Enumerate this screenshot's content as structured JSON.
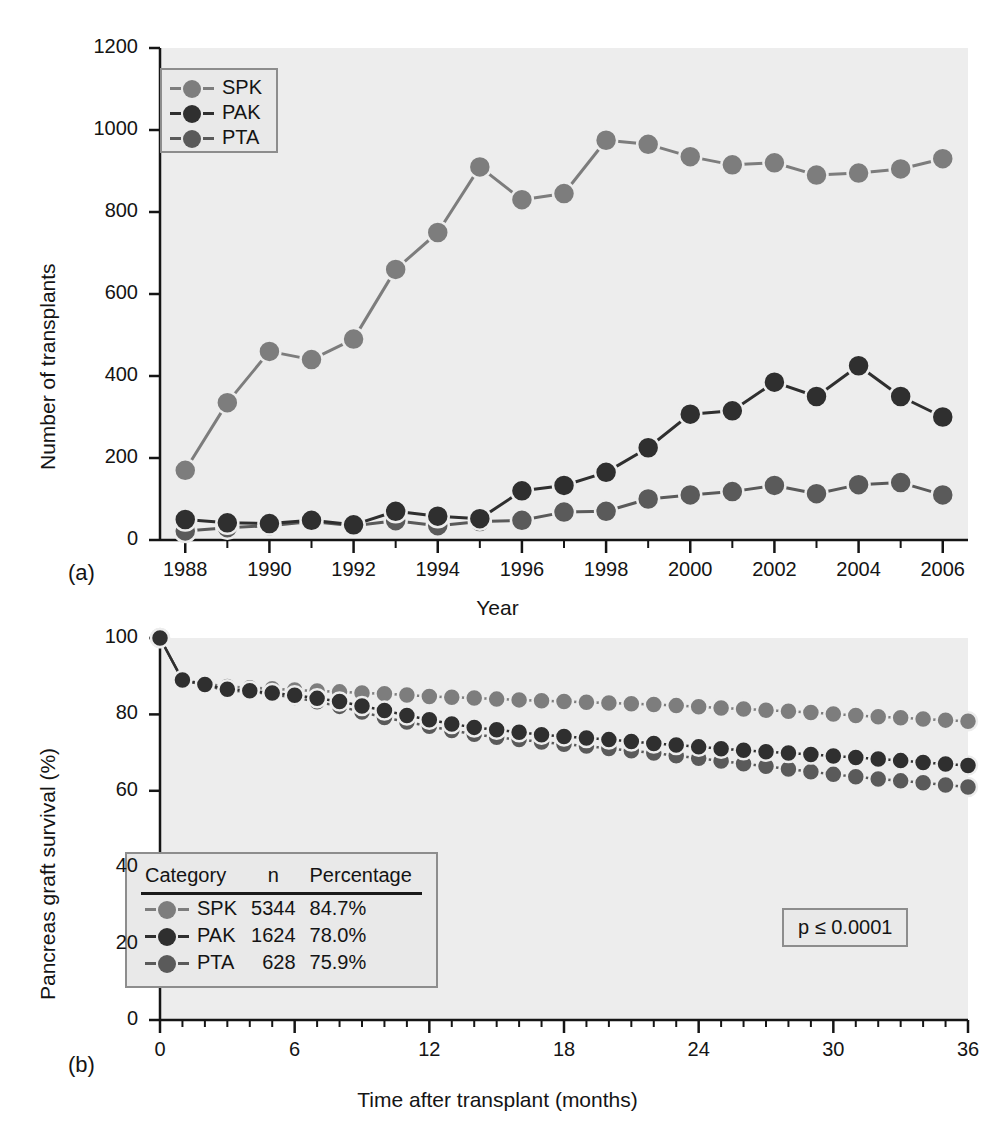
{
  "figure": {
    "panel_a_label": "(a)",
    "panel_b_label": "(b)"
  },
  "colors": {
    "spk": "#7d7d7d",
    "pak": "#2f2f2f",
    "pta": "#5a5a5a",
    "plot_bg": "#ededed",
    "axis": "#151515",
    "legend_border": "#8d8d8d",
    "legend_bg": "#e9e9e9"
  },
  "panel_a": {
    "legend": {
      "items": [
        {
          "label": "SPK",
          "color_key": "spk"
        },
        {
          "label": "PAK",
          "color_key": "pak"
        },
        {
          "label": "PTA",
          "color_key": "pta"
        }
      ]
    },
    "chart_data": {
      "type": "line",
      "title": "",
      "xlabel": "Year",
      "ylabel": "Number of transplants",
      "xlim": [
        1987.4,
        2006.6
      ],
      "ylim": [
        0,
        1200
      ],
      "yticks": [
        0,
        200,
        400,
        600,
        800,
        1000,
        1200
      ],
      "xticks": [
        1988,
        1990,
        1992,
        1994,
        1996,
        1998,
        2000,
        2002,
        2004,
        2006
      ],
      "xtick_labels": [
        "1988",
        "1990",
        "1992",
        "1994",
        "1996",
        "1998",
        "2000",
        "2002",
        "2004",
        "2006"
      ],
      "ytick_labels": [
        "0",
        "200",
        "400",
        "600",
        "800",
        "1000",
        "1200"
      ],
      "x": [
        1988,
        1989,
        1990,
        1991,
        1992,
        1993,
        1994,
        1995,
        1996,
        1997,
        1998,
        1999,
        2000,
        2001,
        2002,
        2003,
        2004,
        2005,
        2006
      ],
      "grid": false,
      "legend_position": "upper-left",
      "series": [
        {
          "name": "SPK",
          "color_key": "spk",
          "values": [
            170,
            335,
            460,
            440,
            490,
            660,
            750,
            910,
            830,
            845,
            975,
            965,
            935,
            915,
            920,
            890,
            895,
            905,
            930
          ]
        },
        {
          "name": "PAK",
          "color_key": "pak",
          "values": [
            50,
            42,
            40,
            48,
            37,
            70,
            58,
            52,
            120,
            133,
            165,
            225,
            307,
            315,
            385,
            350,
            425,
            350,
            300
          ]
        },
        {
          "name": "PTA",
          "color_key": "pta",
          "values": [
            22,
            30,
            35,
            45,
            35,
            47,
            35,
            45,
            48,
            68,
            70,
            100,
            110,
            118,
            133,
            113,
            135,
            140,
            110
          ]
        }
      ]
    }
  },
  "panel_b": {
    "table_legend": {
      "headers": [
        "Category",
        "n",
        "Percentage"
      ],
      "rows": [
        {
          "category": "SPK",
          "n": "5344",
          "percentage": "84.7%",
          "color_key": "spk"
        },
        {
          "category": "PAK",
          "n": "1624",
          "percentage": "78.0%",
          "color_key": "pak"
        },
        {
          "category": "PTA",
          "n": "628",
          "percentage": "75.9%",
          "color_key": "pta"
        }
      ]
    },
    "pvalue": "p ≤ 0.0001",
    "chart_data": {
      "type": "line",
      "title": "",
      "xlabel": "Time after transplant (months)",
      "ylabel": "Pancreas graft survival (%)",
      "xlim": [
        0,
        36
      ],
      "ylim": [
        0,
        100
      ],
      "yticks": [
        0,
        20,
        40,
        60,
        80,
        100
      ],
      "xticks": [
        0,
        6,
        12,
        18,
        24,
        30,
        36
      ],
      "xtick_labels": [
        "0",
        "6",
        "12",
        "18",
        "24",
        "30",
        "36"
      ],
      "ytick_labels": [
        "0",
        "20",
        "40",
        "60",
        "80",
        "100"
      ],
      "x_minor_step": 1,
      "x": [
        0,
        1,
        2,
        3,
        4,
        5,
        6,
        7,
        8,
        9,
        10,
        11,
        12,
        13,
        14,
        15,
        16,
        17,
        18,
        19,
        20,
        21,
        22,
        23,
        24,
        25,
        26,
        27,
        28,
        29,
        30,
        31,
        32,
        33,
        34,
        35,
        36
      ],
      "grid": false,
      "legend_position": "lower-left",
      "series": [
        {
          "name": "SPK",
          "color_key": "spk",
          "final_value": 84.7,
          "values": [
            100.0,
            89.0,
            88.0,
            87.3,
            87.0,
            86.7,
            86.4,
            86.1,
            85.9,
            85.6,
            85.4,
            85.1,
            84.7,
            84.5,
            84.3,
            84.0,
            83.8,
            83.6,
            83.4,
            83.2,
            83.0,
            82.8,
            82.6,
            82.3,
            82.0,
            81.7,
            81.4,
            81.1,
            80.8,
            80.5,
            80.1,
            79.7,
            79.4,
            79.1,
            78.8,
            78.5,
            78.2
          ]
        },
        {
          "name": "PAK",
          "color_key": "pak",
          "final_value": 78.0,
          "values": [
            100.0,
            89.0,
            87.8,
            86.6,
            86.2,
            85.6,
            85.0,
            84.2,
            83.4,
            82.2,
            81.0,
            79.7,
            78.6,
            77.5,
            76.6,
            76.0,
            75.3,
            74.7,
            74.2,
            73.8,
            73.4,
            72.9,
            72.4,
            72.0,
            71.5,
            71.0,
            70.6,
            70.2,
            69.9,
            69.5,
            69.1,
            68.7,
            68.3,
            67.9,
            67.4,
            67.0,
            66.6
          ]
        },
        {
          "name": "PTA",
          "color_key": "pta",
          "final_value": 75.9,
          "values": [
            100.0,
            89.0,
            87.6,
            86.2,
            86.0,
            85.2,
            84.4,
            83.3,
            82.1,
            80.6,
            79.2,
            78.0,
            76.9,
            75.8,
            74.8,
            74.0,
            73.4,
            72.8,
            72.2,
            71.7,
            71.1,
            70.5,
            69.9,
            69.2,
            68.5,
            67.8,
            67.1,
            66.4,
            65.7,
            65.0,
            64.3,
            63.7,
            63.1,
            62.6,
            62.1,
            61.5,
            61.0
          ]
        }
      ]
    }
  }
}
